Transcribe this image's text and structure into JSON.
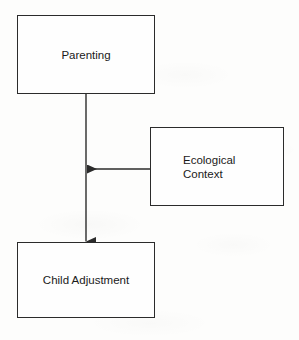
{
  "diagram": {
    "background_color": "#fdfdfc",
    "line_color": "#2b2b2b",
    "text_color": "#1a1a1a",
    "nodes": [
      {
        "id": "parenting",
        "label": "Parenting",
        "shape": "rectangle",
        "x": 17,
        "y": 15,
        "width": 138,
        "height": 79,
        "text_align": "center"
      },
      {
        "id": "ecological_context",
        "label": "Ecological\nContext",
        "shape": "rectangle",
        "x": 150,
        "y": 127,
        "width": 134,
        "height": 79,
        "text_align": "left"
      },
      {
        "id": "child_adjustment",
        "label": "Child Adjustment",
        "shape": "rectangle",
        "x": 17,
        "y": 242,
        "width": 138,
        "height": 76,
        "text_align": "center"
      }
    ],
    "edges": [
      {
        "id": "parenting-to-child",
        "from": "parenting",
        "to": "child_adjustment",
        "label": "",
        "orientation": "vertical",
        "arrowhead": "end"
      },
      {
        "id": "ecological-to-path",
        "from": "ecological_context",
        "to": "parenting-to-child",
        "label": "",
        "orientation": "horizontal",
        "arrowhead": "end"
      }
    ]
  }
}
